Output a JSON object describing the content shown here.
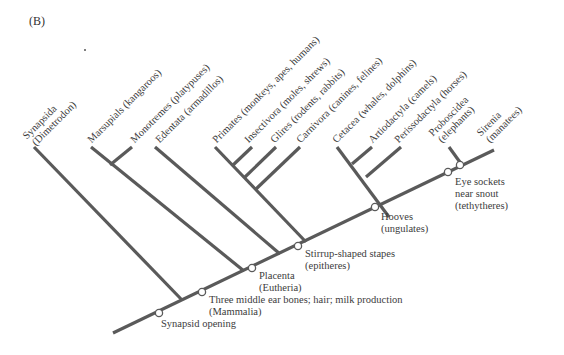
{
  "panel_label": "(B)",
  "colors": {
    "branch": "#5a5a5a",
    "node_fill": "#ffffff",
    "text": "#3c3c3c"
  },
  "taxa": [
    {
      "id": "synapsida",
      "line1": "Synapsida",
      "line2": "(Dimetrodon)"
    },
    {
      "id": "marsupials",
      "line1": "Marsupials (kangaroos)",
      "line2": ""
    },
    {
      "id": "monotremes",
      "line1": "Monotremes (platypuses)",
      "line2": ""
    },
    {
      "id": "edentata",
      "line1": "Edentata (armadillos)",
      "line2": ""
    },
    {
      "id": "primates",
      "line1": "Primates (monkeys, apes, humans)",
      "line2": ""
    },
    {
      "id": "insectivora",
      "line1": "Insectivora (moles, shrews)",
      "line2": ""
    },
    {
      "id": "glires",
      "line1": "Glires (rodents, rabbits)",
      "line2": ""
    },
    {
      "id": "carnivora",
      "line1": "Carnivora (canines, felines)",
      "line2": ""
    },
    {
      "id": "cetacea",
      "line1": "Cetacea (whales, dolphins)",
      "line2": ""
    },
    {
      "id": "artiodactyla",
      "line1": "Artiodactyla (camels)",
      "line2": ""
    },
    {
      "id": "perissodactyla",
      "line1": "Perissodactyla (horses)",
      "line2": ""
    },
    {
      "id": "proboscidea",
      "line1": "Proboscidea",
      "line2": "(elephants)"
    },
    {
      "id": "sirenia",
      "line1": "Sirenia",
      "line2": "(manatees)"
    }
  ],
  "characters": [
    {
      "id": "synapsid-opening",
      "line1": "Synapsid opening",
      "line2": ""
    },
    {
      "id": "mammalia",
      "line1": "Three middle ear bones; hair; milk production",
      "line2": "(Mammalia)"
    },
    {
      "id": "eutheria",
      "line1": "Placenta",
      "line2": "(Eutheria)"
    },
    {
      "id": "epitheres",
      "line1": "Stirrup-shaped stapes",
      "line2": "(epitheres)"
    },
    {
      "id": "ungulates",
      "line1": "Hooves",
      "line2": "(ungulates)"
    },
    {
      "id": "tethytheres",
      "line1": "Eye sockets",
      "line2": "near snout",
      "line3": "(tethytheres)"
    }
  ]
}
